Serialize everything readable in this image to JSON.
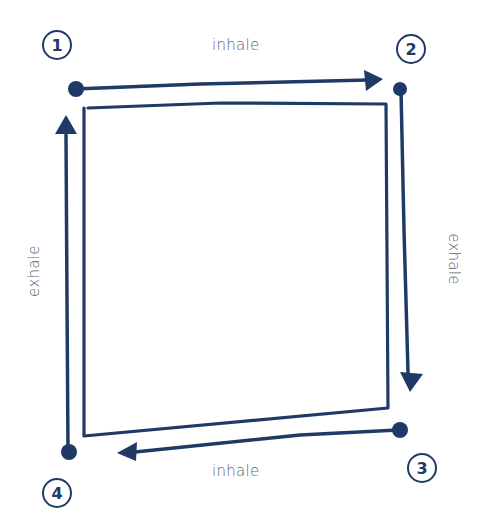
{
  "diagram": {
    "type": "box-breathing",
    "colors": {
      "stroke": "#1f3a66",
      "label": "#5b6275",
      "background": "#ffffff"
    },
    "steps": [
      {
        "number": "1",
        "label": "inhale",
        "side": "top"
      },
      {
        "number": "2",
        "label": "exhale",
        "side": "right"
      },
      {
        "number": "3",
        "label": "inhale",
        "side": "bottom"
      },
      {
        "number": "4",
        "label": "exhale",
        "side": "left"
      }
    ]
  }
}
